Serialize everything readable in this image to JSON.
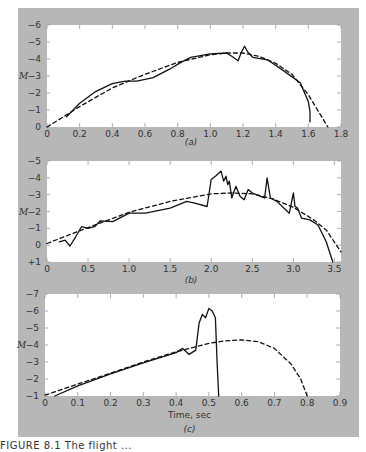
{
  "caption": "FIGURE 8.1     The flight ...",
  "chart_data": [
    {
      "type": "line",
      "panel_label": "(a)",
      "ylabel": "M",
      "xlabel": "",
      "xlim": [
        0,
        1.8
      ],
      "ylim": [
        0,
        -6
      ],
      "xticks": [
        "0",
        "0.2",
        "0.4",
        "0.6",
        "0.8",
        "1.0",
        "1.2",
        "1.4",
        "1.6",
        "1.8"
      ],
      "yticks": [
        "0",
        "-1",
        "-2",
        "-3",
        "-4",
        "-5",
        "-6"
      ],
      "series": [
        {
          "name": "measured",
          "style": "solid",
          "x": [
            0.12,
            0.2,
            0.3,
            0.4,
            0.48,
            0.55,
            0.65,
            0.75,
            0.82,
            0.88,
            1.0,
            1.1,
            1.14,
            1.17,
            1.19,
            1.21,
            1.23,
            1.26,
            1.35,
            1.45,
            1.55,
            1.6,
            1.61,
            1.61
          ],
          "y": [
            -0.6,
            -1.4,
            -2.1,
            -2.55,
            -2.7,
            -2.7,
            -2.9,
            -3.4,
            -3.8,
            -4.1,
            -4.3,
            -4.35,
            -4.1,
            -3.9,
            -4.4,
            -4.75,
            -4.4,
            -4.1,
            -3.95,
            -3.3,
            -2.6,
            -1.5,
            -0.9,
            -0.3
          ]
        },
        {
          "name": "predicted",
          "style": "dashed",
          "x": [
            0,
            0.2,
            0.4,
            0.6,
            0.8,
            1.0,
            1.1,
            1.2,
            1.3,
            1.4,
            1.5,
            1.6,
            1.65,
            1.72
          ],
          "y": [
            0,
            -1.2,
            -2.3,
            -3.1,
            -3.8,
            -4.25,
            -4.35,
            -4.35,
            -4.15,
            -3.75,
            -3.1,
            -1.9,
            -1.1,
            0
          ]
        }
      ]
    },
    {
      "type": "line",
      "panel_label": "(b)",
      "ylabel": "M",
      "xlabel": "",
      "xlim": [
        0,
        3.58
      ],
      "ylim": [
        1,
        -5
      ],
      "xticks": [
        "0",
        "0.5",
        "1.0",
        "1.5",
        "2.0",
        "2.5",
        "3.0",
        "3.5"
      ],
      "yticks": [
        "+1",
        "0",
        "-1",
        "-2",
        "-3",
        "-4",
        "-5"
      ],
      "series": [
        {
          "name": "measured",
          "style": "solid",
          "x": [
            0.15,
            0.22,
            0.28,
            0.35,
            0.42,
            0.5,
            0.58,
            0.65,
            0.8,
            1.0,
            1.2,
            1.5,
            1.7,
            1.8,
            1.95,
            2.0,
            2.05,
            2.12,
            2.15,
            2.18,
            2.2,
            2.22,
            2.25,
            2.3,
            2.35,
            2.4,
            2.45,
            2.5,
            2.55,
            2.6,
            2.65,
            2.68,
            2.72,
            2.8,
            2.95,
            3.0,
            3.02,
            3.05,
            3.1,
            3.2,
            3.3,
            3.4,
            3.48
          ],
          "y": [
            -0.2,
            -0.3,
            0.05,
            -0.5,
            -1.1,
            -1.0,
            -1.1,
            -1.45,
            -1.4,
            -1.9,
            -1.9,
            -2.2,
            -2.6,
            -2.5,
            -2.3,
            -3.9,
            -4.1,
            -4.4,
            -3.8,
            -4.1,
            -3.6,
            -3.8,
            -2.8,
            -3.5,
            -2.9,
            -2.7,
            -3.3,
            -3.1,
            -3.0,
            -2.9,
            -2.8,
            -4.0,
            -2.8,
            -2.6,
            -1.9,
            -3.1,
            -2.3,
            -2.2,
            -1.6,
            -1.5,
            -1.2,
            -0.2,
            1.0
          ]
        },
        {
          "name": "predicted",
          "style": "dashed",
          "x": [
            0,
            0.5,
            1.0,
            1.5,
            2.0,
            2.25,
            2.5,
            2.75,
            3.0,
            3.25,
            3.4,
            3.58
          ],
          "y": [
            -0.1,
            -1.05,
            -1.95,
            -2.6,
            -3.05,
            -3.1,
            -3.05,
            -2.75,
            -2.25,
            -1.5,
            -0.9,
            0.4
          ]
        }
      ]
    },
    {
      "type": "line",
      "panel_label": "(c)",
      "ylabel": "M",
      "xlabel": "Time, sec",
      "xlim": [
        0,
        0.9
      ],
      "ylim": [
        -1,
        -7
      ],
      "xticks": [
        "0",
        "0.1",
        "0.2",
        "0.3",
        "0.4",
        "0.5",
        "0.6",
        "0.7",
        "0.8",
        "0.9"
      ],
      "yticks": [
        "-1",
        "-2",
        "-3",
        "-4",
        "-5",
        "-6",
        "-7"
      ],
      "series": [
        {
          "name": "measured",
          "style": "solid",
          "x": [
            0.03,
            0.1,
            0.2,
            0.3,
            0.4,
            0.42,
            0.44,
            0.46,
            0.47,
            0.48,
            0.49,
            0.5,
            0.51,
            0.52,
            0.525,
            0.53
          ],
          "y": [
            -1.0,
            -1.6,
            -2.3,
            -2.95,
            -3.55,
            -3.8,
            -3.45,
            -3.7,
            -5.3,
            -5.8,
            -5.6,
            -6.15,
            -6.0,
            -5.6,
            -3.0,
            -1.0
          ]
        },
        {
          "name": "predicted",
          "style": "dashed",
          "x": [
            0,
            0.1,
            0.2,
            0.3,
            0.4,
            0.5,
            0.55,
            0.6,
            0.65,
            0.7,
            0.75,
            0.78,
            0.8
          ],
          "y": [
            -1.05,
            -1.7,
            -2.35,
            -3.0,
            -3.6,
            -4.1,
            -4.25,
            -4.3,
            -4.2,
            -3.8,
            -2.9,
            -2.0,
            -1.0
          ]
        }
      ]
    }
  ]
}
